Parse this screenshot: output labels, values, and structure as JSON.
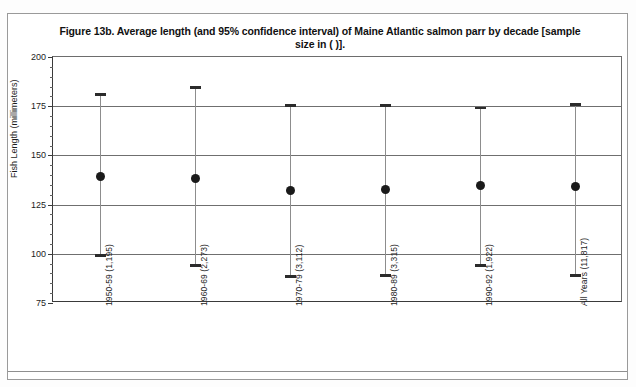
{
  "figure": {
    "title": "Figure 13b. Average length (and 95% confidence interval) of Maine Atlantic salmon parr by decade [sample size in ( )].",
    "y_axis_title": "Fish Length (millimeters)"
  },
  "chart_data": {
    "type": "scatter",
    "title": "Figure 13b. Average length (and 95% confidence interval) of Maine Atlantic salmon parr by decade [sample size in ( )].",
    "xlabel": "",
    "ylabel": "Fish Length (millimeters)",
    "ylim": [
      75,
      200
    ],
    "ytick_labels": [
      "200",
      "175",
      "150",
      "125",
      "100",
      "75"
    ],
    "yticks": [
      200,
      175,
      150,
      125,
      100,
      75
    ],
    "y_minor_tick_step": 5,
    "grid": "horizontal",
    "legend": "none",
    "error_bars": "95% confidence interval",
    "categories": [
      "1950-59 (1,195)",
      "1960-69 (2,273)",
      "1970-79 (3,112)",
      "1980-89 (3,315)",
      "1990-92 (1,922)",
      "All Years (11,817)"
    ],
    "sample_sizes": [
      1195,
      2273,
      3112,
      3315,
      1922,
      11817
    ],
    "values": [
      139.5,
      138.5,
      132.0,
      132.5,
      134.5,
      134.0
    ],
    "ci_lower": [
      99.0,
      94.0,
      88.5,
      89.0,
      94.0,
      89.0
    ],
    "ci_upper": [
      181.0,
      184.5,
      175.5,
      175.5,
      174.0,
      176.0
    ],
    "series": [
      {
        "name": "Average length",
        "values": [
          139.5,
          138.5,
          132.0,
          132.5,
          134.5,
          134.0
        ]
      }
    ]
  }
}
